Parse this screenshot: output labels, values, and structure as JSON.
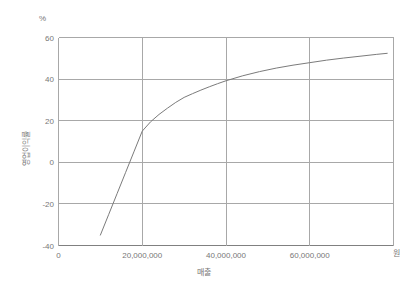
{
  "chart_data": {
    "type": "line",
    "title": "",
    "xlabel": "매출",
    "ylabel": "영업이익률",
    "x_unit": "원",
    "y_unit": "%",
    "xlim": [
      0,
      80000000
    ],
    "ylim": [
      -40,
      60
    ],
    "grid": true,
    "legend": false,
    "xticks": [
      0,
      20000000,
      40000000,
      60000000
    ],
    "xtick_labels": [
      "0",
      "20,000,000",
      "40,000,000",
      "60,000,000"
    ],
    "yticks": [
      -40,
      -20,
      0,
      20,
      40,
      60
    ],
    "ytick_labels": [
      "-40",
      "-20",
      "0",
      "20",
      "40",
      "60"
    ],
    "series": [
      {
        "name": "영업이익률",
        "color": "#7b7b7b",
        "x": [
          10000000,
          12000000,
          14000000,
          16000000,
          18000000,
          20000000,
          22000000,
          24000000,
          26000000,
          28000000,
          30000000,
          32000000,
          34000000,
          36000000,
          38000000,
          40000000,
          44000000,
          48000000,
          52000000,
          56000000,
          60000000,
          64000000,
          68000000,
          72000000,
          76000000,
          78500000
        ],
        "y": [
          -35.0,
          -25.0,
          -15.0,
          -5.0,
          5.0,
          15.0,
          19.5,
          23.0,
          26.0,
          28.8,
          31.2,
          33.0,
          34.7,
          36.3,
          37.8,
          39.2,
          41.6,
          43.6,
          45.3,
          46.7,
          47.9,
          49.1,
          50.1,
          51.0,
          51.9,
          52.4
        ]
      }
    ],
    "annotations": []
  },
  "style": {
    "axis_color": "#808080",
    "grid_color": "#a8a8a8",
    "text_color": "#777777",
    "background": "#ffffff"
  }
}
